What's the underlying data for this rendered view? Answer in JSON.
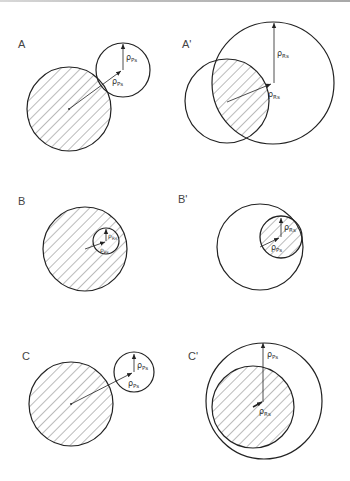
{
  "figure": {
    "panels": [
      {
        "id": "A",
        "label": "A",
        "label_pos": [
          18,
          45
        ]
      },
      {
        "id": "A2",
        "label": "A'",
        "label_pos": [
          182,
          45
        ]
      },
      {
        "id": "B",
        "label": "B",
        "label_pos": [
          18,
          200
        ]
      },
      {
        "id": "B2",
        "label": "B'",
        "label_pos": [
          179,
          195
        ]
      },
      {
        "id": "C",
        "label": "C",
        "label_pos": [
          22,
          352
        ]
      },
      {
        "id": "C2",
        "label": "C'",
        "label_pos": [
          189,
          349
        ]
      }
    ],
    "vector_labels": {
      "rho_p": "ρ",
      "sub_p": "Ps",
      "rho_r": "ρ",
      "sub_r": "Rs"
    },
    "colors": {
      "stroke": "#222222",
      "hatch": "#555555",
      "text": "#444444",
      "background": "#ffffff"
    }
  }
}
